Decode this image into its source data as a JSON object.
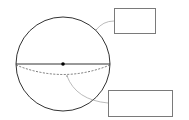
{
  "diagram": {
    "type": "sphere-labeling",
    "sphere": {
      "cx": 63,
      "cy": 64,
      "r": 47,
      "stroke": "#333333"
    },
    "diameter_line": {
      "x1": 16,
      "y1": 64,
      "x2": 110,
      "y2": 64,
      "stroke": "#333333"
    },
    "center_point": {
      "cx": 63,
      "cy": 64,
      "r": 1.8,
      "fill": "#000000"
    },
    "equator_arc": {
      "style": "dashed",
      "stroke": "#555555"
    },
    "leader_color": "#aaaaaa",
    "labels": [
      {
        "id": "top",
        "text": ""
      },
      {
        "id": "bottom",
        "text": ""
      }
    ]
  }
}
